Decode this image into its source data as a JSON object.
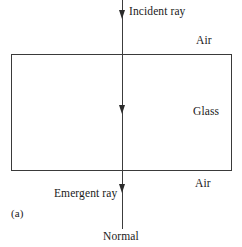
{
  "figure": {
    "panel_label": "(a)",
    "background_color": "#ffffff",
    "line_color": "#3a3a3a",
    "text_color": "#1a1a1a"
  },
  "labels": {
    "incident_ray": "Incident ray",
    "air_top": "Air",
    "glass": "Glass",
    "air_bottom": "Air",
    "emergent_ray": "Emergent ray",
    "normal": "Normal"
  },
  "diagram": {
    "slab": {
      "name": "glass-slab",
      "medium": "Glass",
      "surrounding_medium": "Air"
    },
    "ray": {
      "name": "normal-incidence-ray",
      "direction": "downward",
      "arrow_count": 3,
      "segments": [
        "Incident ray",
        "Glass",
        "Emergent ray"
      ]
    }
  }
}
